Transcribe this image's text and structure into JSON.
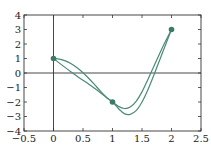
{
  "chart_data": {
    "type": "line",
    "title": "",
    "xlabel": "",
    "ylabel": "",
    "xlim": [
      -0.5,
      2.5
    ],
    "ylim": [
      -4,
      4
    ],
    "grid": false,
    "legend": null,
    "x_ticks": [
      "-0.5",
      "0",
      "0.5",
      "1",
      "1.5",
      "2",
      "2.5"
    ],
    "y_ticks": [
      "4",
      "3",
      "2",
      "1",
      "0",
      "-1",
      "-2",
      "-3",
      "-4"
    ],
    "markers": [
      {
        "x": 0,
        "y": 1
      },
      {
        "x": 1,
        "y": -2
      },
      {
        "x": 2,
        "y": 3
      }
    ],
    "series": [
      {
        "name": "curve-upper",
        "color": "#4a8a78",
        "x": [
          0,
          0.1,
          0.2,
          0.3,
          0.4,
          0.5,
          0.6,
          0.7,
          0.8,
          0.9,
          1.0,
          1.1,
          1.2,
          1.3,
          1.4,
          1.5,
          1.6,
          1.7,
          1.8,
          1.9,
          2.0
        ],
        "y": [
          1,
          0.96,
          0.84,
          0.64,
          0.36,
          0.02,
          -0.38,
          -0.82,
          -1.27,
          -1.68,
          -2.0,
          -2.3,
          -2.45,
          -2.35,
          -1.95,
          -1.3,
          -0.45,
          0.45,
          1.35,
          2.2,
          3.0
        ]
      },
      {
        "name": "curve-lower",
        "color": "#4a8a78",
        "x": [
          0,
          0.1,
          0.2,
          0.3,
          0.4,
          0.5,
          0.6,
          0.7,
          0.8,
          0.9,
          1.0,
          1.1,
          1.2,
          1.3,
          1.4,
          1.5,
          1.6,
          1.7,
          1.8,
          1.9,
          2.0
        ],
        "y": [
          1,
          0.68,
          0.37,
          0.07,
          -0.22,
          -0.5,
          -0.78,
          -1.07,
          -1.38,
          -1.7,
          -2.0,
          -2.45,
          -2.8,
          -2.85,
          -2.6,
          -2.0,
          -1.15,
          -0.15,
          0.9,
          1.95,
          3.0
        ]
      }
    ]
  }
}
